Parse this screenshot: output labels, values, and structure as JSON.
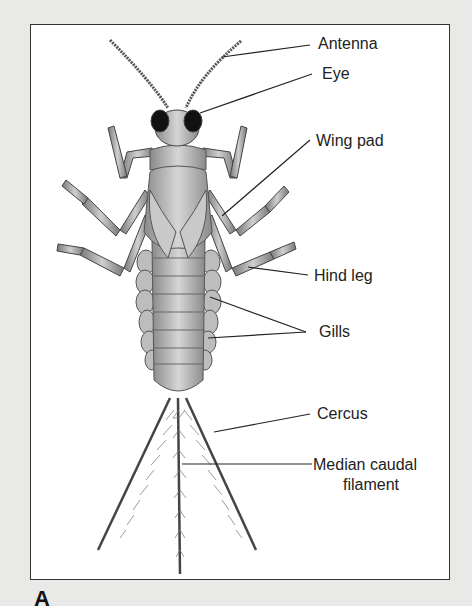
{
  "figure": {
    "panel_letter": "A",
    "labels": [
      {
        "id": "antenna",
        "text": "Antenna"
      },
      {
        "id": "eye",
        "text": "Eye"
      },
      {
        "id": "wing_pad",
        "text": "Wing pad"
      },
      {
        "id": "hind_leg",
        "text": "Hind leg"
      },
      {
        "id": "gills",
        "text": "Gills"
      },
      {
        "id": "cercus",
        "text": "Cercus"
      },
      {
        "id": "median_caudal_filament_1",
        "text": "Median caudal"
      },
      {
        "id": "median_caudal_filament_2",
        "text": "filament"
      }
    ]
  },
  "colors": {
    "background": "#e9e9e7",
    "frame": "#ffffff",
    "ink": "#222222"
  }
}
